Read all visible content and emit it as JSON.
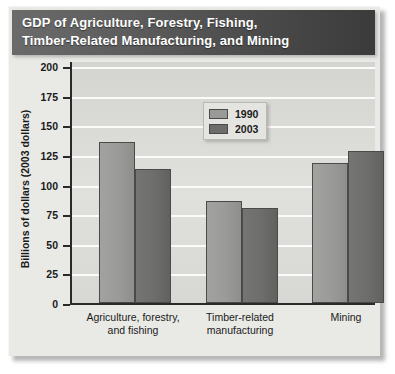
{
  "title": {
    "line1": "GDP of Agriculture, Forestry, Fishing,",
    "line2": "Timber-Related Manufacturing, and Mining"
  },
  "axis": {
    "y_title": "Billions of dollars (2003 dollars)",
    "y_ticks": [
      "0",
      "25",
      "50",
      "75",
      "100",
      "125",
      "150",
      "175",
      "200"
    ]
  },
  "legend": {
    "items": [
      {
        "label": "1990",
        "color": "#9a9a98"
      },
      {
        "label": "2003",
        "color": "#6d6d6b"
      }
    ]
  },
  "categories": [
    {
      "line1": "Agriculture, forestry,",
      "line2": "and fishing"
    },
    {
      "line1": "Timber-related",
      "line2": "manufacturing"
    },
    {
      "line1": "Mining",
      "line2": ""
    }
  ],
  "chart_data": {
    "type": "bar",
    "title": "GDP of Agriculture, Forestry, Fishing, Timber-Related Manufacturing, and Mining",
    "xlabel": "",
    "ylabel": "Billions of dollars (2003 dollars)",
    "ylim": [
      0,
      200
    ],
    "ytick_step": 25,
    "yticks": [
      0,
      25,
      50,
      75,
      100,
      125,
      150,
      175,
      200
    ],
    "grid": "horizontal",
    "legend_position": "inside-top-center",
    "categories": [
      "Agriculture, forestry, and fishing",
      "Timber-related manufacturing",
      "Mining"
    ],
    "series": [
      {
        "name": "1990",
        "color": "#9a9a98",
        "values": [
          136,
          86,
          118
        ]
      },
      {
        "name": "2003",
        "color": "#6d6d6b",
        "values": [
          113,
          80,
          128
        ]
      }
    ]
  }
}
